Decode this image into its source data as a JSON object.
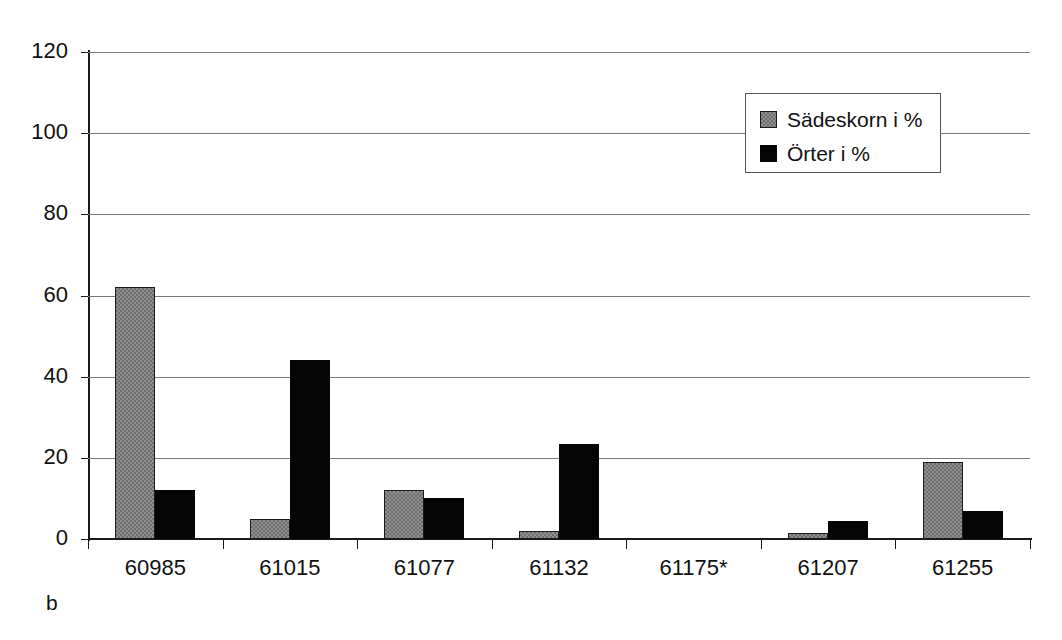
{
  "figure": {
    "panel_label": "b"
  },
  "legend": {
    "position": "top-right",
    "entries": [
      {
        "label": "Sädeskorn i %",
        "swatch": "gray-pattern-swatch",
        "color": "#8f8f8f"
      },
      {
        "label": "Örter i %",
        "swatch": "black-swatch",
        "color": "#050505"
      }
    ]
  },
  "chart_data": {
    "type": "bar",
    "title": "",
    "subtitle": "",
    "xlabel": "",
    "ylabel": "",
    "categories": [
      "60985",
      "61015",
      "61077",
      "61132",
      "61175*",
      "61207",
      "61255"
    ],
    "series": [
      {
        "name": "Sädeskorn i %",
        "color": "#8f8f8f",
        "values": [
          62,
          5,
          12,
          2,
          0,
          1.5,
          19
        ]
      },
      {
        "name": "Örter i %",
        "color": "#050505",
        "values": [
          12,
          44,
          10,
          23.5,
          0,
          4.5,
          6.8
        ]
      }
    ],
    "ylim": [
      0,
      120
    ],
    "yticks": [
      0,
      20,
      40,
      60,
      80,
      100,
      120
    ],
    "ytick_labels": [
      "0",
      "20",
      "40",
      "60",
      "80",
      "100",
      "120"
    ],
    "grid": true,
    "grid_axis": "y",
    "legend_position": "top-right",
    "bar_group_gap": true
  }
}
